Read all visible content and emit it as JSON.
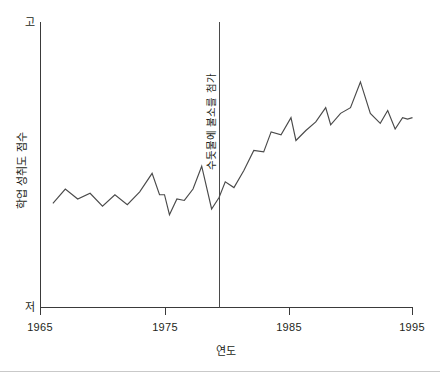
{
  "chart_data": {
    "type": "line",
    "title": "",
    "xlabel": "연도",
    "ylabel": "학업 성취도 점수",
    "xlim": [
      1965,
      1995
    ],
    "ylim": [
      0,
      100
    ],
    "ytick_labels": [
      "고",
      "저"
    ],
    "ytick_label_high": "고",
    "ytick_label_low": "저",
    "xtick_labels": [
      "1965",
      "1975",
      "1985",
      "1995"
    ],
    "xticks": [
      1965,
      1975,
      1985,
      1995
    ],
    "grid": false,
    "legend": null,
    "annotations": [
      {
        "text": "수돗물에 불소를 첨가",
        "type": "vertical-line-with-label",
        "x": 1979.3,
        "orientation": "vertical"
      }
    ],
    "series": [
      {
        "name": "학업 성취도 점수",
        "color": "#4a4a4a",
        "x": [
          1966.0,
          1967.0,
          1968.0,
          1969.0,
          1970.0,
          1971.0,
          1972.0,
          1973.0,
          1974.0,
          1974.6,
          1975.0,
          1975.4,
          1976.0,
          1976.6,
          1977.3,
          1978.0,
          1978.8,
          1979.4,
          1979.9,
          1980.6,
          1981.4,
          1982.2,
          1983.0,
          1983.6,
          1984.4,
          1985.2,
          1985.6,
          1986.4,
          1987.2,
          1988.0,
          1988.4,
          1989.2,
          1990.0,
          1990.8,
          1991.6,
          1992.4,
          1993.0,
          1993.6,
          1994.2,
          1994.6,
          1995.0
        ],
        "y": [
          36.5,
          41.5,
          38.0,
          40.0,
          35.5,
          39.5,
          36.0,
          40.5,
          47.0,
          39.5,
          39.5,
          32.5,
          38.0,
          37.5,
          41.5,
          49.5,
          34.5,
          38.5,
          44.0,
          42.0,
          48.0,
          55.0,
          54.5,
          61.5,
          60.5,
          66.5,
          58.5,
          62.0,
          65.0,
          70.0,
          64.0,
          68.0,
          70.0,
          79.0,
          68.0,
          64.5,
          69.0,
          62.5,
          66.5,
          66.0,
          66.5
        ]
      }
    ]
  },
  "figure": {
    "background_color": "#ffffff",
    "axis_color": "#3a3a3a",
    "line_color": "#4a4a4a"
  }
}
